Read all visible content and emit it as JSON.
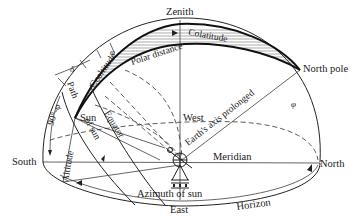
{
  "figure": {
    "type": "celestial-sphere-diagram"
  },
  "labels": {
    "zenith": "Zenith",
    "colatitude_top": "Colatitude",
    "polar_distance": "Polar distance",
    "coaltitude": "Coaltitude",
    "north_pole": "North pole",
    "path_of_sun_a": "Path",
    "path_of_sun_b": "of sun",
    "sun": "Sun",
    "equator": "Equator",
    "west": "West",
    "earths_axis": "Earth's axis prolonged",
    "south": "South",
    "north": "North",
    "meridian": "Meridian",
    "altitude": "Altitude",
    "azimuth": "Azimuth of sun",
    "east": "East",
    "horizon": "Horizon",
    "ninety_minus_phi": "90°-φ",
    "delta": "δ",
    "phi_top": "φ",
    "phi_right": "φ"
  },
  "colors": {
    "line": "#222222",
    "background": "#ffffff",
    "hatch": "#555555"
  }
}
